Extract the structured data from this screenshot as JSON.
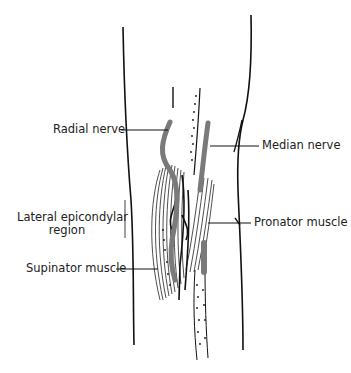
{
  "diagram": {
    "labels": {
      "radial_nerve": "Radial nerve",
      "median_nerve": "Median nerve",
      "lateral_epicondylar_line1": "Lateral epicondylar",
      "lateral_epicondylar_line2": "region",
      "pronator_muscle": "Pronator muscle",
      "supinator_muscle": "Supinator muscle"
    },
    "colors": {
      "outline": "#111111",
      "nerve": "#7a7a7a",
      "label": "#222222"
    }
  }
}
